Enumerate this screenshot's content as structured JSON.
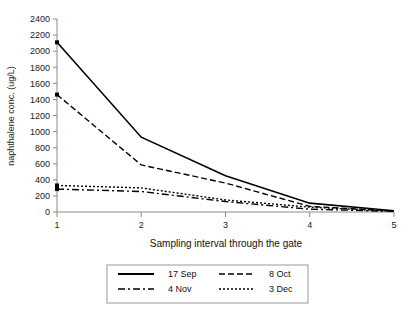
{
  "chart_data": {
    "type": "line",
    "title": "",
    "xlabel": "Sampling interval through the gate",
    "ylabel": "naphthalene conc. (ug/L)",
    "x": [
      1,
      2,
      3,
      4,
      5
    ],
    "xtick_labels": [
      "1",
      "2",
      "3",
      "4",
      "5"
    ],
    "xlim": [
      1,
      5
    ],
    "ylim": [
      0,
      2400
    ],
    "ytick_labels": [
      "0",
      "200",
      "400",
      "600",
      "800",
      "1000",
      "1200",
      "1400",
      "1600",
      "1800",
      "2000",
      "2200",
      "2400"
    ],
    "ytick_values": [
      0,
      200,
      400,
      600,
      800,
      1000,
      1200,
      1400,
      1600,
      1800,
      2000,
      2200,
      2400
    ],
    "grid": false,
    "legend_position": "bottom",
    "series": [
      {
        "name": "17 Sep",
        "style": "solid",
        "dash": "none",
        "values": [
          2110,
          930,
          450,
          110,
          15
        ]
      },
      {
        "name": "8 Oct",
        "style": "dashed",
        "dash": "6,3",
        "values": [
          1460,
          585,
          360,
          70,
          12
        ]
      },
      {
        "name": "4 Nov",
        "style": "dashdot",
        "dash": "7,3,2,3",
        "values": [
          285,
          255,
          130,
          35,
          8
        ]
      },
      {
        "name": "3 Dec",
        "style": "dotted",
        "dash": "2,2",
        "values": [
          330,
          300,
          150,
          60,
          10
        ]
      }
    ]
  },
  "legend": {
    "entries": [
      {
        "label": "17 Sep"
      },
      {
        "label": "8 Oct"
      },
      {
        "label": "4 Nov"
      },
      {
        "label": "3 Dec"
      }
    ]
  },
  "colors": {
    "line": "#000000",
    "axis": "#808080",
    "text": "#1a1a1a",
    "background": "#ffffff"
  }
}
